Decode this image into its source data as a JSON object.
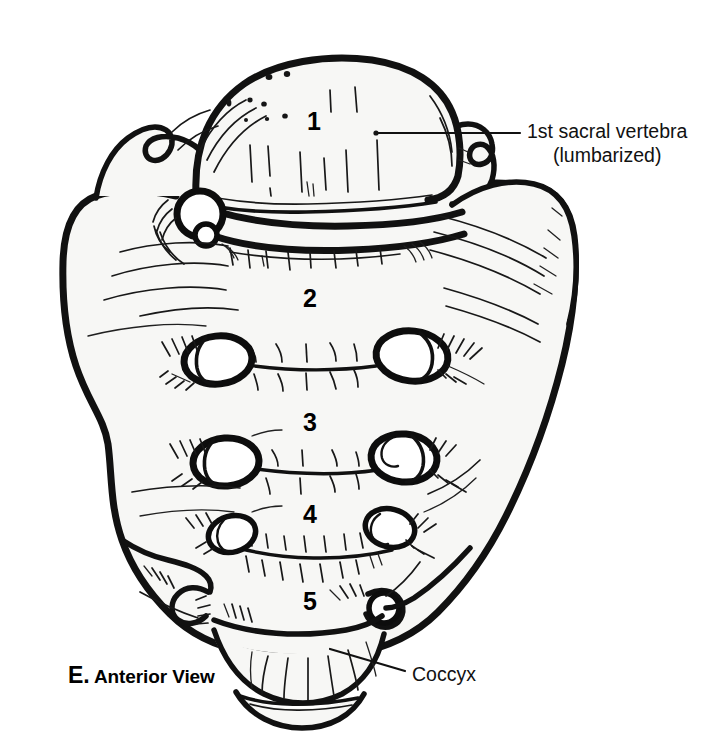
{
  "figure": {
    "panel_letter": "E.",
    "view_name": "Anterior View",
    "style": "black-and-white line illustration"
  },
  "callouts": [
    {
      "id": "s1",
      "line1": "1st sacral vertebra",
      "line2": "(lumbarized)",
      "leader_from": [
        375,
        133
      ],
      "leader_to": [
        520,
        133
      ]
    },
    {
      "id": "coccyx",
      "line1": "Coccyx",
      "line2": "",
      "leader_from": [
        330,
        650
      ],
      "leader_to": [
        405,
        672
      ]
    }
  ],
  "vertebra_numbers": [
    {
      "label": "1",
      "x": 314,
      "y": 123
    },
    {
      "label": "2",
      "x": 310,
      "y": 300
    },
    {
      "label": "3",
      "x": 310,
      "y": 424
    },
    {
      "label": "4",
      "x": 310,
      "y": 516
    },
    {
      "label": "5",
      "x": 310,
      "y": 603
    }
  ],
  "colors": {
    "ink": "#111111",
    "bone_fill": "#f7f7f5",
    "background": "#ffffff",
    "text": "#000000"
  }
}
